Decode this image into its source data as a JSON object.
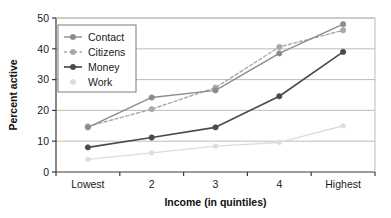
{
  "chart_data": {
    "type": "line",
    "title": "",
    "subtitle": "",
    "xlabel": "Income (in quintiles)",
    "ylabel": "Percent active",
    "categories": [
      "Lowest",
      "2",
      "3",
      "4",
      "Highest"
    ],
    "ylim": [
      0,
      50
    ],
    "yticks": [
      0,
      10,
      20,
      30,
      40,
      50
    ],
    "ytick_labels": [
      "0",
      "10",
      "20",
      "30",
      "40",
      "50"
    ],
    "grid": "horizontal",
    "legend_position": "upper-left-inside",
    "series": [
      {
        "name": "Contact",
        "values": [
          14.5,
          24.2,
          26.5,
          38.5,
          48.0
        ],
        "color": "#8c8c8c",
        "style": "solid",
        "marker": "circle"
      },
      {
        "name": "Citizens",
        "values": [
          14.8,
          20.4,
          27.4,
          40.6,
          46.0
        ],
        "color": "#a8a8a8",
        "style": "dashed",
        "marker": "circle"
      },
      {
        "name": "Money",
        "values": [
          8.0,
          11.2,
          14.5,
          24.6,
          39.0
        ],
        "color": "#4a4a4a",
        "style": "solid",
        "marker": "circle"
      },
      {
        "name": "Work",
        "values": [
          4.1,
          6.2,
          8.4,
          9.6,
          15.0
        ],
        "color": "#dcdcdc",
        "style": "solid",
        "marker": "circle"
      }
    ]
  },
  "axis": {
    "y_title": "Percent active",
    "x_title": "Income (in quintiles)",
    "y_tick_0": "0",
    "y_tick_1": "10",
    "y_tick_2": "20",
    "y_tick_3": "30",
    "y_tick_4": "40",
    "y_tick_5": "50",
    "x_tick_0": "Lowest",
    "x_tick_1": "2",
    "x_tick_2": "3",
    "x_tick_3": "4",
    "x_tick_4": "Highest"
  },
  "legend": {
    "items": [
      {
        "label": "Contact"
      },
      {
        "label": "Citizens"
      },
      {
        "label": "Money"
      },
      {
        "label": "Work"
      }
    ]
  },
  "colors": {
    "contact": "#8c8c8c",
    "citizens": "#a8a8a8",
    "money": "#4a4a4a",
    "work": "#dcdcdc",
    "grid": "#b5b5b5",
    "axis": "#3a3a3a",
    "text": "#1a1a1a",
    "background": "#ffffff"
  }
}
